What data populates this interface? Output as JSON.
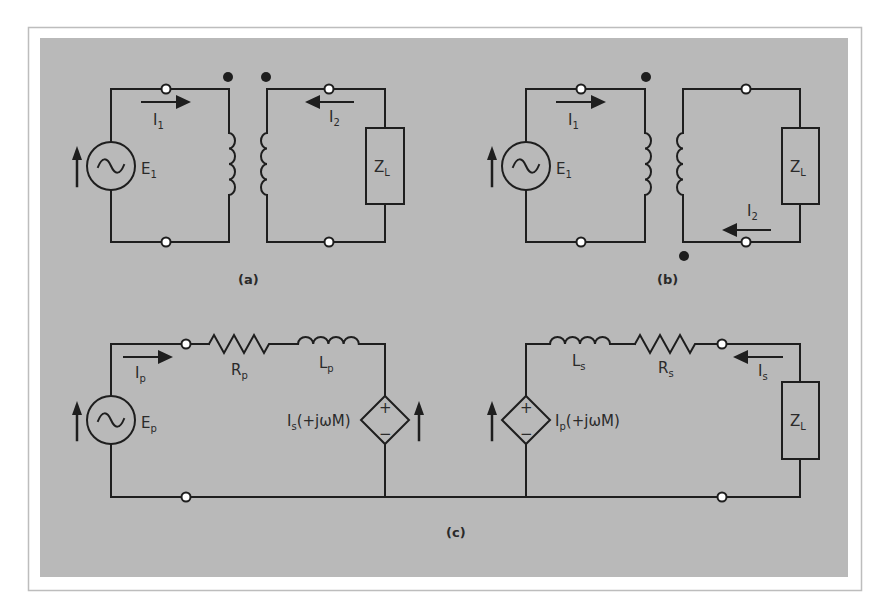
{
  "figure": {
    "colors": {
      "panel": "#b9b9b9",
      "frame": "#bdbdbd",
      "wire": "#1e1e1e",
      "background": "#ffffff"
    },
    "panel_a": {
      "caption": "(a)",
      "source": {
        "label": "E",
        "sub": "1",
        "icon": "ac-source-icon"
      },
      "current_primary": {
        "label": "I",
        "sub": "1",
        "direction": "right"
      },
      "current_secondary": {
        "label": "I",
        "sub": "2",
        "direction": "left"
      },
      "load": {
        "label": "Z",
        "sub": "L"
      },
      "dots": "both-top"
    },
    "panel_b": {
      "caption": "(b)",
      "source": {
        "label": "E",
        "sub": "1",
        "icon": "ac-source-icon"
      },
      "current_primary": {
        "label": "I",
        "sub": "1",
        "direction": "right"
      },
      "current_secondary": {
        "label": "I",
        "sub": "2",
        "direction": "left"
      },
      "load": {
        "label": "Z",
        "sub": "L"
      },
      "dots": "primary-top-secondary-bottom"
    },
    "panel_c": {
      "caption": "(c)",
      "source": {
        "label": "E",
        "sub": "p",
        "icon": "ac-source-icon"
      },
      "current_primary": {
        "label": "I",
        "sub": "p",
        "direction": "right"
      },
      "current_secondary": {
        "label": "I",
        "sub": "s",
        "direction": "left"
      },
      "rp": {
        "label": "R",
        "sub": "p"
      },
      "lp": {
        "label": "L",
        "sub": "p"
      },
      "ls": {
        "label": "L",
        "sub": "s"
      },
      "rs": {
        "label": "R",
        "sub": "s"
      },
      "load": {
        "label": "Z",
        "sub": "L"
      },
      "dep_primary": {
        "pre": "I",
        "sub": "s",
        "post": "(+jωM)",
        "plus": "+",
        "minus": "−"
      },
      "dep_secondary": {
        "pre": "I",
        "sub": "p",
        "post": "(+jωM)",
        "plus": "+",
        "minus": "−"
      }
    }
  }
}
